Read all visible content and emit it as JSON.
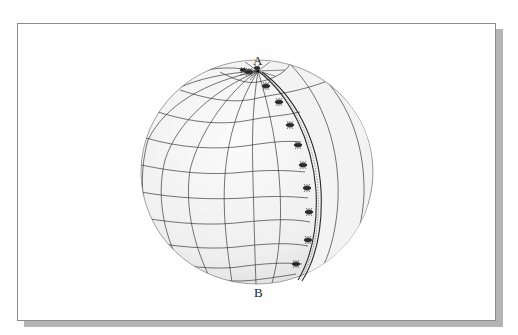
{
  "figure": {
    "labels": {
      "top": "A",
      "bottom": "B"
    },
    "colors": {
      "frame_border": "#8c8c8c",
      "shadow": "#b4b4b4",
      "sphere_fill": "#f0f0f0",
      "grid_line": "#3a3a3a",
      "ant": "#2a2a2a"
    },
    "icons": [
      "sphere-icon",
      "ant-icon"
    ],
    "ant_count": 12
  }
}
